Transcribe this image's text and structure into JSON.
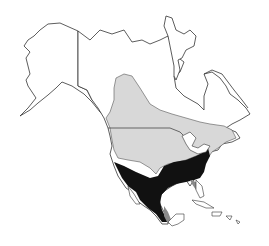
{
  "map": {
    "region": "North America",
    "legend": [],
    "colors": {
      "background": "#ffffff",
      "outline": "#333333",
      "land": "#ffffff",
      "range_light": "#d8d8d8",
      "range_dark": "#111111",
      "range_mid": "#8a8a8a"
    },
    "zones": [
      {
        "name": "light-range",
        "description": "Northern / central range (light gray)"
      },
      {
        "name": "dark-range",
        "description": "Southern range (black)"
      },
      {
        "name": "mid-range",
        "description": "Coastal fringe (medium gray)"
      }
    ]
  }
}
